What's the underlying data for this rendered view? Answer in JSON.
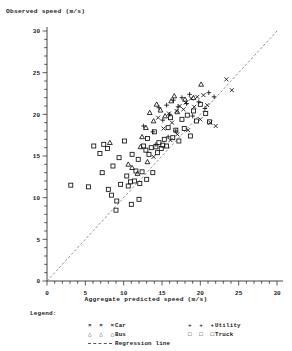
{
  "axes": {
    "ylabel": "Observed speed (m/s)",
    "xlabel": "Aggregate predicted speed (m/s)",
    "xticks": [
      "0",
      "5",
      "10",
      "15",
      "20",
      "25",
      "30"
    ],
    "yticks": [
      "0",
      "5",
      "10",
      "15",
      "20",
      "25",
      "30"
    ]
  },
  "legend": {
    "title": "Legend:",
    "items": [
      {
        "name": "car",
        "symbols": "× × ×",
        "label": "Car"
      },
      {
        "name": "bus",
        "symbols": "△ △ △",
        "label": "Bus"
      },
      {
        "name": "regression-line",
        "symbols": "line",
        "label": "Regression line"
      },
      {
        "name": "utility",
        "symbols": "+ + +",
        "label": "Utility"
      },
      {
        "name": "truck",
        "symbols": "□ □ □",
        "label": "Truck"
      }
    ]
  },
  "chart_data": {
    "type": "scatter",
    "title": "",
    "xlabel": "Aggregate predicted speed (m/s)",
    "ylabel": "Observed speed (m/s)",
    "xlim": [
      0,
      30
    ],
    "ylim": [
      0,
      30
    ],
    "xticks": [
      0,
      5,
      10,
      15,
      20,
      25,
      30
    ],
    "yticks": [
      0,
      5,
      10,
      15,
      20,
      25,
      30
    ],
    "grid": false,
    "legend_position": "below-axes",
    "regression_line": {
      "label": "Regression line",
      "style": "dashed",
      "color": "#666666",
      "x": [
        0,
        30
      ],
      "y": [
        0,
        30
      ]
    },
    "series": [
      {
        "name": "Car",
        "marker": "x",
        "color": "#111111",
        "points": [
          [
            14.5,
            19.6
          ],
          [
            15.2,
            18.3
          ],
          [
            15.9,
            20.1
          ],
          [
            16.3,
            19.0
          ],
          [
            16.9,
            20.4
          ],
          [
            17.3,
            21.0
          ],
          [
            17.8,
            20.6
          ],
          [
            18.1,
            21.4
          ],
          [
            18.4,
            18.1
          ],
          [
            18.8,
            21.9
          ],
          [
            19.2,
            20.9
          ],
          [
            19.6,
            22.1
          ],
          [
            20.0,
            19.4
          ],
          [
            20.4,
            22.3
          ],
          [
            20.9,
            21.1
          ],
          [
            21.3,
            19.0
          ],
          [
            22.0,
            18.6
          ],
          [
            23.4,
            24.2
          ],
          [
            24.1,
            22.9
          ],
          [
            16.1,
            16.9
          ],
          [
            17.0,
            17.6
          ],
          [
            13.9,
            14.9
          ]
        ]
      },
      {
        "name": "Bus",
        "marker": "triangle",
        "color": "#111111",
        "points": [
          [
            8.2,
            16.6
          ],
          [
            11.1,
            13.6
          ],
          [
            12.4,
            17.3
          ],
          [
            12.9,
            18.4
          ],
          [
            13.4,
            20.2
          ],
          [
            13.9,
            19.2
          ],
          [
            14.3,
            21.2
          ],
          [
            14.8,
            20.5
          ],
          [
            15.4,
            19.8
          ],
          [
            16.2,
            21.6
          ],
          [
            16.6,
            22.2
          ],
          [
            17.0,
            20.3
          ],
          [
            18.0,
            21.8
          ],
          [
            19.1,
            22.0
          ],
          [
            20.1,
            23.6
          ],
          [
            10.6,
            14.0
          ],
          [
            11.8,
            12.9
          ],
          [
            12.2,
            16.1
          ],
          [
            13.1,
            14.3
          ]
        ]
      },
      {
        "name": "Utility",
        "marker": "plus",
        "color": "#111111",
        "points": [
          [
            12.6,
            18.6
          ],
          [
            13.8,
            17.9
          ],
          [
            14.6,
            20.8
          ],
          [
            15.1,
            19.3
          ],
          [
            15.6,
            21.1
          ],
          [
            16.0,
            20.0
          ],
          [
            16.5,
            21.7
          ],
          [
            17.1,
            20.9
          ],
          [
            17.6,
            22.0
          ],
          [
            18.2,
            21.3
          ],
          [
            18.6,
            22.4
          ],
          [
            19.0,
            19.8
          ],
          [
            19.8,
            21.5
          ],
          [
            20.6,
            20.7
          ],
          [
            21.1,
            22.6
          ],
          [
            21.8,
            22.1
          ],
          [
            14.2,
            16.4
          ],
          [
            15.8,
            17.3
          ],
          [
            16.8,
            18.0
          ]
        ]
      },
      {
        "name": "Truck",
        "marker": "square",
        "color": "#111111",
        "points": [
          [
            3.1,
            11.5
          ],
          [
            5.4,
            11.3
          ],
          [
            6.1,
            16.2
          ],
          [
            6.9,
            15.3
          ],
          [
            7.4,
            16.4
          ],
          [
            7.9,
            15.9
          ],
          [
            8.0,
            11.0
          ],
          [
            8.6,
            13.8
          ],
          [
            9.1,
            9.6
          ],
          [
            9.4,
            14.8
          ],
          [
            9.6,
            11.6
          ],
          [
            10.1,
            16.8
          ],
          [
            10.4,
            12.6
          ],
          [
            10.6,
            11.4
          ],
          [
            10.9,
            11.9
          ],
          [
            11.1,
            15.2
          ],
          [
            11.4,
            12.0
          ],
          [
            11.6,
            13.2
          ],
          [
            11.9,
            14.6
          ],
          [
            12.1,
            11.7
          ],
          [
            12.4,
            13.1
          ],
          [
            12.6,
            16.2
          ],
          [
            12.9,
            15.7
          ],
          [
            13.1,
            17.1
          ],
          [
            13.3,
            15.2
          ],
          [
            13.6,
            16.0
          ],
          [
            13.8,
            13.0
          ],
          [
            14.0,
            17.9
          ],
          [
            14.2,
            16.1
          ],
          [
            14.4,
            15.4
          ],
          [
            14.6,
            16.6
          ],
          [
            14.9,
            15.9
          ],
          [
            15.1,
            16.3
          ],
          [
            15.3,
            17.0
          ],
          [
            15.6,
            16.2
          ],
          [
            15.8,
            18.4
          ],
          [
            16.1,
            19.6
          ],
          [
            16.4,
            17.2
          ],
          [
            16.8,
            18.1
          ],
          [
            17.2,
            16.8
          ],
          [
            17.6,
            19.4
          ],
          [
            17.9,
            18.3
          ],
          [
            18.3,
            19.9
          ],
          [
            18.7,
            17.4
          ],
          [
            19.1,
            20.4
          ],
          [
            19.5,
            19.2
          ],
          [
            20.0,
            21.2
          ],
          [
            20.7,
            20.1
          ],
          [
            21.2,
            19.1
          ],
          [
            9.0,
            8.5
          ],
          [
            11.0,
            9.2
          ],
          [
            12.0,
            9.8
          ],
          [
            8.4,
            10.3
          ],
          [
            7.2,
            13.0
          ],
          [
            13.0,
            12.2
          ]
        ]
      }
    ]
  }
}
